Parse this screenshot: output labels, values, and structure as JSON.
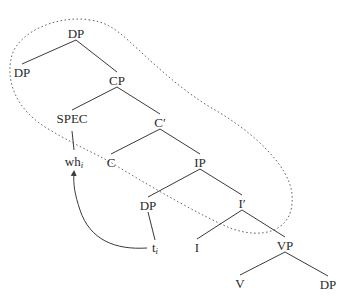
{
  "diagram": {
    "type": "syntax-tree",
    "nodes": {
      "dp_top": {
        "label": "DP",
        "x": 76,
        "y": 33
      },
      "dp_left": {
        "label": "DP",
        "x": 22,
        "y": 72
      },
      "cp": {
        "label": "CP",
        "x": 117,
        "y": 80
      },
      "spec": {
        "label": "SPEC",
        "x": 72,
        "y": 118
      },
      "c_bar": {
        "label": "C′",
        "x": 160,
        "y": 122
      },
      "wh": {
        "label": "wh",
        "sub": "i",
        "x": 74,
        "y": 162
      },
      "c": {
        "label": "C",
        "x": 111,
        "y": 162
      },
      "ip": {
        "label": "IP",
        "x": 200,
        "y": 162
      },
      "dp_mid": {
        "label": "DP",
        "x": 148,
        "y": 205
      },
      "i_bar": {
        "label": "I′",
        "x": 242,
        "y": 203
      },
      "trace": {
        "label": "t",
        "sub": "i",
        "x": 155,
        "y": 248
      },
      "i": {
        "label": "I",
        "x": 197,
        "y": 247
      },
      "vp": {
        "label": "VP",
        "x": 285,
        "y": 245
      },
      "v": {
        "label": "V",
        "x": 240,
        "y": 283
      },
      "dp_bottom": {
        "label": "DP",
        "x": 328,
        "y": 284
      }
    },
    "edges": [
      [
        "dp_top",
        "dp_left"
      ],
      [
        "dp_top",
        "cp"
      ],
      [
        "cp",
        "spec"
      ],
      [
        "cp",
        "c_bar"
      ],
      [
        "spec",
        "wh"
      ],
      [
        "c_bar",
        "c"
      ],
      [
        "c_bar",
        "ip"
      ],
      [
        "ip",
        "dp_mid"
      ],
      [
        "ip",
        "i_bar"
      ],
      [
        "dp_mid",
        "trace"
      ],
      [
        "i_bar",
        "i"
      ],
      [
        "i_bar",
        "vp"
      ],
      [
        "vp",
        "v"
      ],
      [
        "vp",
        "dp_bottom"
      ]
    ],
    "movement_arrow": {
      "from": "trace",
      "to": "wh",
      "style": "curved-arrow"
    },
    "dashed_region": {
      "encloses": [
        "dp_top",
        "dp_left",
        "cp",
        "spec",
        "c_bar",
        "c",
        "ip",
        "i_bar"
      ],
      "style": "dotted"
    },
    "colors": {
      "line": "#3a3a3a",
      "text": "#2a2a2a",
      "dashed": "#555555"
    }
  }
}
